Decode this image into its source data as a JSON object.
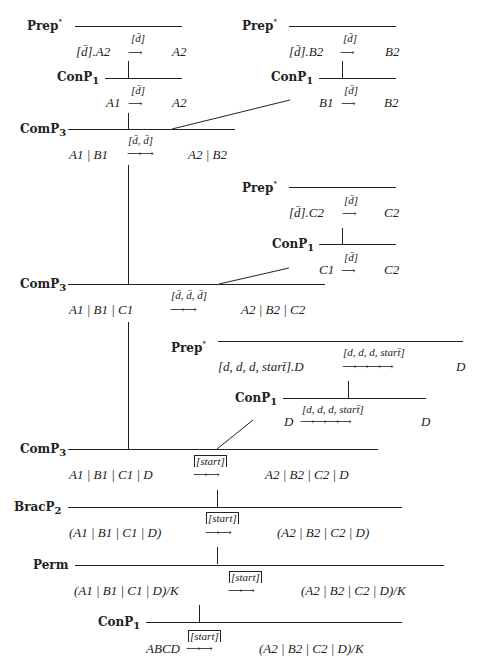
{
  "diagram_type": "proof-tree",
  "nodes": [
    {
      "id": "prepA",
      "rule": "Prep",
      "rule_sup": "*",
      "rule_sub": "",
      "lhs": "[d̄].A2",
      "action": "[d̄]",
      "rhs": "A2"
    },
    {
      "id": "conA",
      "rule": "ConP",
      "rule_sub": "1",
      "rule_sup": "",
      "lhs": "A1",
      "action": "[d̄]",
      "rhs": "A2"
    },
    {
      "id": "prepB",
      "rule": "Prep",
      "rule_sup": "*",
      "rule_sub": "",
      "lhs": "[d̄].B2",
      "action": "[d̄]",
      "rhs": "B2"
    },
    {
      "id": "conB",
      "rule": "ConP",
      "rule_sub": "1",
      "rule_sup": "",
      "lhs": "B1",
      "action": "[d̄]",
      "rhs": "B2"
    },
    {
      "id": "comAB",
      "rule": "ComP",
      "rule_sub": "3",
      "rule_sup": "",
      "lhs": "A1 | B1",
      "action": "[d̄, d̄]",
      "rhs": "A2 | B2"
    },
    {
      "id": "prepC",
      "rule": "Prep",
      "rule_sup": "*",
      "rule_sub": "",
      "lhs": "[d̄].C2",
      "action": "[d̄]",
      "rhs": "C2"
    },
    {
      "id": "conC",
      "rule": "ConP",
      "rule_sub": "1",
      "rule_sup": "",
      "lhs": "C1",
      "action": "[d̄]",
      "rhs": "C2"
    },
    {
      "id": "comABC",
      "rule": "ComP",
      "rule_sub": "3",
      "rule_sup": "",
      "lhs": "A1 | B1 | C1",
      "action": "[d̄, d̄, d̄]",
      "rhs": "A2 | B2 | C2"
    },
    {
      "id": "prepD",
      "rule": "Prep",
      "rule_sup": "*",
      "rule_sub": "",
      "lhs": "[d, d, d, start̄].D",
      "action": "[d, d, d, start̄]",
      "rhs": "D"
    },
    {
      "id": "conD",
      "rule": "ConP",
      "rule_sub": "1",
      "rule_sup": "",
      "lhs": "D",
      "action": "[d, d, d, start̄]",
      "rhs": "D"
    },
    {
      "id": "comABCD",
      "rule": "ComP",
      "rule_sub": "3",
      "rule_sup": "",
      "lhs": "A1 | B1 | C1 | D",
      "action": "[start]",
      "rhs": "A2 | B2 | C2 | D"
    },
    {
      "id": "brac",
      "rule": "BracP",
      "rule_sub": "2",
      "rule_sup": "",
      "lhs": "(A1 | B1 | C1 | D)",
      "action": "[start]",
      "rhs": "(A2 | B2 | C2 | D)"
    },
    {
      "id": "perm",
      "rule": "Perm",
      "rule_sub": "",
      "rule_sup": "",
      "lhs": "(A1 | B1 | C1 | D)/K",
      "action": "[start]",
      "rhs": "(A2 | B2 | C2 | D)/K"
    },
    {
      "id": "conRoot",
      "rule": "ConP",
      "rule_sub": "1",
      "rule_sup": "",
      "lhs": "ABCD",
      "action": "[start]",
      "rhs": "(A2 | B2 | C2 | D)/K"
    }
  ]
}
